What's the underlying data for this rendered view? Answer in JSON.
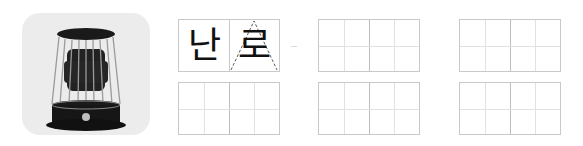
{
  "picture": {
    "icon": "kerosene-heater-icon",
    "alt": "kerosene heater"
  },
  "word": {
    "syllables": [
      "난",
      "로"
    ],
    "hint_syllable_index": 1
  },
  "practice_boxes": [
    {
      "id": "box-1",
      "row": 0,
      "col": 0,
      "filled": true
    },
    {
      "id": "box-2",
      "row": 0,
      "col": 1,
      "filled": false
    },
    {
      "id": "box-3",
      "row": 0,
      "col": 2,
      "filled": false
    },
    {
      "id": "box-4",
      "row": 1,
      "col": 0,
      "filled": false
    },
    {
      "id": "box-5",
      "row": 1,
      "col": 1,
      "filled": false
    },
    {
      "id": "box-6",
      "row": 1,
      "col": 2,
      "filled": false
    }
  ],
  "colors": {
    "grid_border": "#c9c9c9",
    "grid_inner": "#e2e2e2",
    "picture_bg": "#ececec",
    "ink": "#111111"
  }
}
